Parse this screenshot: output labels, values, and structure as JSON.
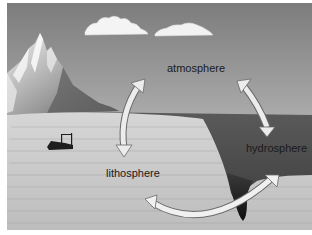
{
  "diagram": {
    "type": "earth-systems-cycle",
    "labels": {
      "atmosphere": "atmosphere",
      "hydrosphere": "hydrosphere",
      "lithosphere": "lithosphere"
    },
    "arrows": [
      {
        "from": "atmosphere",
        "to": "lithosphere",
        "direction": "bidirectional"
      },
      {
        "from": "atmosphere",
        "to": "hydrosphere",
        "direction": "bidirectional"
      },
      {
        "from": "lithosphere",
        "to": "hydrosphere",
        "direction": "bidirectional"
      }
    ],
    "illustration": [
      "clouds",
      "snowy-mountain",
      "shipwreck",
      "ocean",
      "ocean-trench",
      "seafloor-rock"
    ],
    "colors": {
      "sky_top": "#7a7a7a",
      "sky_bottom": "#c8c8c8",
      "ocean": "#4a4a4a",
      "land": "#c4c4c4",
      "arrow_fill": "#e8e8e8",
      "arrow_stroke": "#6a6a6a",
      "text": "#1a1a1a"
    }
  }
}
